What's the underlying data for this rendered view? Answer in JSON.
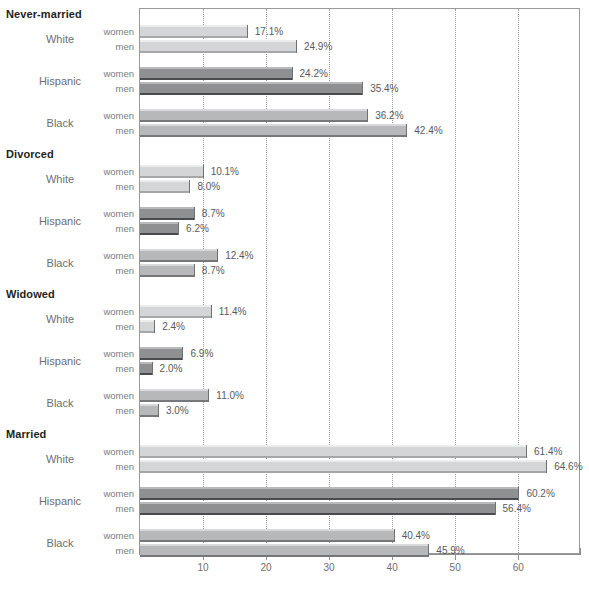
{
  "chart_data": {
    "type": "bar",
    "orientation": "horizontal",
    "title": "",
    "xlabel": "",
    "ylabel": "",
    "xlim": [
      0,
      69.8
    ],
    "xticks": [
      10,
      20,
      30,
      40,
      50,
      60
    ],
    "xticklabels": [
      "10",
      "20",
      "30",
      "40",
      "50",
      "60"
    ],
    "grid": "vertical-dotted",
    "legend": "none",
    "value_suffix": "%",
    "series": [
      {
        "name": "women"
      },
      {
        "name": "men"
      }
    ],
    "groups": [
      {
        "section": "Never-married",
        "races": [
          {
            "race": "White",
            "values": [
              17.1,
              24.9
            ],
            "labels": [
              "17.1%",
              "24.9%"
            ]
          },
          {
            "race": "Hispanic",
            "values": [
              24.2,
              35.4
            ],
            "labels": [
              "24.2%",
              "35.4%"
            ]
          },
          {
            "race": "Black",
            "values": [
              36.2,
              42.4
            ],
            "labels": [
              "36.2%",
              "42.4%"
            ]
          }
        ]
      },
      {
        "section": "Divorced",
        "races": [
          {
            "race": "White",
            "values": [
              10.1,
              8.0
            ],
            "labels": [
              "10.1%",
              "8.0%"
            ]
          },
          {
            "race": "Hispanic",
            "values": [
              8.7,
              6.2
            ],
            "labels": [
              "8.7%",
              "6.2%"
            ]
          },
          {
            "race": "Black",
            "values": [
              12.4,
              8.7
            ],
            "labels": [
              "12.4%",
              "8.7%"
            ]
          }
        ]
      },
      {
        "section": "Widowed",
        "races": [
          {
            "race": "White",
            "values": [
              11.4,
              2.4
            ],
            "labels": [
              "11.4%",
              "2.4%"
            ]
          },
          {
            "race": "Hispanic",
            "values": [
              6.9,
              2.0
            ],
            "labels": [
              "6.9%",
              "2.0%"
            ]
          },
          {
            "race": "Black",
            "values": [
              11.0,
              3.0
            ],
            "labels": [
              "11.0%",
              "3.0%"
            ]
          }
        ]
      },
      {
        "section": "Married",
        "races": [
          {
            "race": "White",
            "values": [
              61.4,
              64.6
            ],
            "labels": [
              "61.4%",
              "64.6%"
            ]
          },
          {
            "race": "Hispanic",
            "values": [
              60.2,
              56.4
            ],
            "labels": [
              "60.2%",
              "56.4%"
            ]
          },
          {
            "race": "Black",
            "values": [
              40.4,
              45.9
            ],
            "labels": [
              "40.4%",
              "45.9%"
            ]
          }
        ]
      }
    ],
    "colors": {
      "white_bar": "#d4d5d6",
      "hispanic_bar": "#8e9092",
      "black_bar": "#b6b8b9",
      "gridline": "#9f9f9f",
      "axis": "#8c8d8f",
      "section_title_text": "#231f20",
      "label_text": "#6d6e70"
    }
  },
  "source_note": ""
}
